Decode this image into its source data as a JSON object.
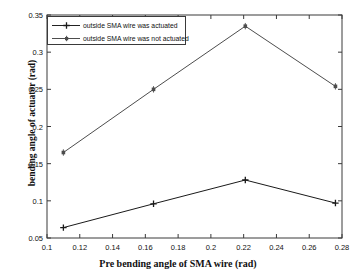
{
  "chart_data": {
    "type": "line",
    "title": "",
    "xlabel": "Pre bending angle of SMA wire (rad)",
    "ylabel": "bending angle of actuator (rad)",
    "xlim": [
      0.1,
      0.28
    ],
    "ylim": [
      0.05,
      0.35
    ],
    "xticks": [
      0.1,
      0.12,
      0.14,
      0.16,
      0.18,
      0.2,
      0.22,
      0.24,
      0.26,
      0.28
    ],
    "xtick_labels": [
      "0.1",
      "0.12",
      "0.14",
      "0.16",
      "0.18",
      "0.2",
      "0.22",
      "0.24",
      "0.26",
      "0.28"
    ],
    "yticks": [
      0.05,
      0.1,
      0.15,
      0.2,
      0.25,
      0.3,
      0.35
    ],
    "ytick_labels": [
      "0.05",
      "0.1",
      "0.15",
      "0.2",
      "0.25",
      "0.3",
      "0.35"
    ],
    "grid": false,
    "legend_position": "upper-left",
    "x": [
      0.11,
      0.165,
      0.221,
      0.276
    ],
    "series": [
      {
        "name": "outside SMA wire was actuated",
        "marker": "plus",
        "color": "#1a1a1a",
        "values": [
          0.064,
          0.096,
          0.128,
          0.097
        ]
      },
      {
        "name": "outside SMA wire was not actuated",
        "marker": "square",
        "color": "#4d4d4d",
        "values": [
          0.165,
          0.25,
          0.335,
          0.254
        ]
      }
    ]
  },
  "axes": {
    "frame_color": "#3a3a3a",
    "background": "#ffffff"
  },
  "legend": {
    "entries": [
      "outside SMA wire was actuated",
      "outside SMA wire was not actuated"
    ]
  }
}
